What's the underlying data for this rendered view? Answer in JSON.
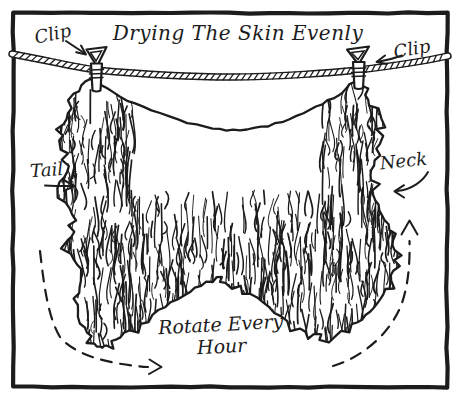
{
  "illustration": {
    "title": "Drying The Skin Evenly",
    "clip_left": "Clip",
    "clip_right": "Clip",
    "tail": "Tail",
    "neck": "Neck",
    "rotate_line1": "Rotate Every",
    "rotate_line2": "Hour",
    "colors": {
      "ink": "#1c1c1c",
      "paper": "#ffffff"
    }
  }
}
